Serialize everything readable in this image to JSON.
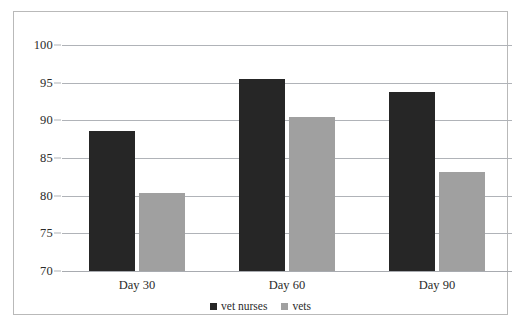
{
  "chart_data": {
    "type": "bar",
    "title": "",
    "subtitle": "",
    "xlabel": "",
    "ylabel": "",
    "categories": [
      "Day 30",
      "Day 60",
      "Day 90"
    ],
    "series": [
      {
        "name": "vet nurses",
        "color": "#262626",
        "values": [
          88.6,
          95.5,
          93.8
        ]
      },
      {
        "name": "vets",
        "color": "#a0a0a0",
        "values": [
          80.4,
          90.5,
          83.2
        ]
      }
    ],
    "ylim": [
      70,
      100
    ],
    "yticks": [
      70,
      75,
      80,
      85,
      90,
      95,
      100
    ],
    "ytick_labels": [
      "70",
      "75",
      "80",
      "85",
      "90",
      "95",
      "100"
    ],
    "grid": "horizontal",
    "legend_position": "bottom-center",
    "border": true,
    "border_color": "#b9b9b9",
    "gridline_color": "#b0b3b8",
    "background": "#ffffff"
  },
  "legend": {
    "items": [
      {
        "label": "vet nurses"
      },
      {
        "label": "vets"
      }
    ]
  },
  "axis": {
    "ticks": [
      {
        "label": "100"
      },
      {
        "label": "95"
      },
      {
        "label": "90"
      },
      {
        "label": "85"
      },
      {
        "label": "80"
      },
      {
        "label": "75"
      },
      {
        "label": "70"
      }
    ]
  },
  "groups": [
    {
      "label": "Day 30"
    },
    {
      "label": "Day 60"
    },
    {
      "label": "Day 90"
    }
  ]
}
